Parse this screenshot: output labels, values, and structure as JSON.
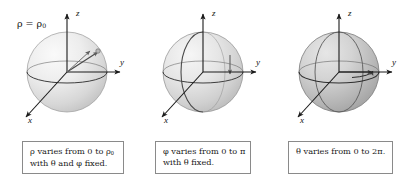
{
  "figure": {
    "background_color": "#ffffff",
    "sphere_outline_color": "#5a5a5a",
    "axis_color": "#1a1a1a",
    "caption_border_color": "#8a8a8a"
  },
  "panels": [
    {
      "id": "panel-rho",
      "sphere_fill_light": "#f2f2f2",
      "sphere_fill_dark": "#c9c9c9",
      "annotation_label": "ρ = ρ",
      "annotation_sub": "0",
      "axes": {
        "z": "z",
        "y": "y",
        "x": "x"
      },
      "caption": {
        "line1_pre": "ρ varies from 0 to ρ",
        "line1_sub": "0",
        "line2": "with θ and φ fixed."
      },
      "varying_symbol": "ρ",
      "ray_label": "ρ"
    },
    {
      "id": "panel-phi",
      "sphere_fill_light": "#ececec",
      "sphere_fill_dark": "#c2c2c2",
      "axes": {
        "z": "z",
        "y": "y",
        "x": "x"
      },
      "caption": {
        "line1": "φ varies from 0 to π",
        "line2": "with θ fixed."
      },
      "varying_symbol": "φ"
    },
    {
      "id": "panel-theta",
      "sphere_fill_light": "#d8d8d8",
      "sphere_fill_dark": "#a8a8a8",
      "axes": {
        "z": "z",
        "y": "y",
        "x": "x"
      },
      "caption": {
        "line1": "θ varies from 0 to 2π."
      },
      "varying_symbol": "θ"
    }
  ]
}
